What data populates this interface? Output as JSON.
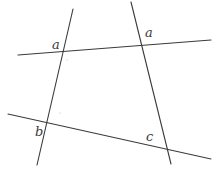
{
  "diagram": {
    "width": 216,
    "height": 175,
    "line_color": "#3a3a3a",
    "lines": [
      {
        "name": "left-transversal",
        "x1": 73,
        "y1": 9,
        "x2": 37,
        "y2": 165
      },
      {
        "name": "right-transversal",
        "x1": 131,
        "y1": 2,
        "x2": 171,
        "y2": 164
      },
      {
        "name": "top-line",
        "x1": 18,
        "y1": 55,
        "x2": 211,
        "y2": 40
      },
      {
        "name": "bottom-line",
        "x1": 8,
        "y1": 114,
        "x2": 211,
        "y2": 159
      }
    ],
    "labels": [
      {
        "name": "angle-label-a-left",
        "text": "a",
        "x": 52,
        "y": 49
      },
      {
        "name": "angle-label-a-right",
        "text": "a",
        "x": 145,
        "y": 37
      },
      {
        "name": "angle-label-b",
        "text": "b",
        "x": 35,
        "y": 136
      },
      {
        "name": "angle-label-c",
        "text": "c",
        "x": 146,
        "y": 141
      }
    ]
  }
}
